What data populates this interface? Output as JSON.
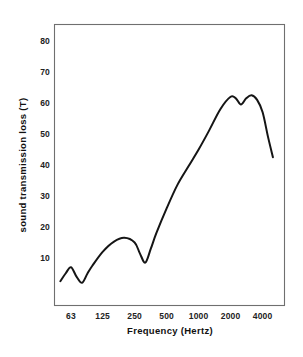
{
  "figure": {
    "background_color": "#ffffff",
    "frame_color": "#6f6f6f",
    "curve_color": "#151515"
  },
  "chart_data": {
    "type": "line",
    "title": "",
    "subtitle": "",
    "xlabel": "Frequency   (Hertz)",
    "ylabel": "sound transmission loss (T)",
    "x_scale": "log2-octave",
    "x_tick_labels": [
      "63",
      "125",
      "250",
      "500",
      "1000",
      "2000",
      "4000"
    ],
    "x_tick_values": [
      63,
      125,
      250,
      500,
      1000,
      2000,
      4000
    ],
    "y_tick_labels": [
      "10",
      "20",
      "30",
      "40",
      "50",
      "60",
      "70",
      "80"
    ],
    "y_tick_values": [
      10,
      20,
      30,
      40,
      50,
      60,
      70,
      80
    ],
    "ylim": [
      0,
      86
    ],
    "xlim": [
      44,
      5900
    ],
    "grid": false,
    "legend": null,
    "series": [
      {
        "name": "sound transmission loss",
        "x": [
          50,
          56,
          63,
          71,
          80,
          90,
          100,
          125,
          160,
          200,
          250,
          280,
          315,
          355,
          400,
          500,
          630,
          800,
          1000,
          1250,
          1600,
          2000,
          2240,
          2500,
          2800,
          3150,
          3550,
          4000,
          4500,
          5000
        ],
        "y": [
          2.5,
          5.0,
          7.0,
          4.0,
          2.0,
          5.0,
          7.5,
          12.0,
          15.3,
          16.5,
          15.0,
          11.5,
          8.5,
          13.0,
          18.0,
          26.0,
          33.5,
          39.5,
          45.0,
          51.0,
          58.0,
          62.0,
          61.5,
          59.5,
          61.5,
          62.5,
          61.0,
          57.0,
          49.0,
          42.5
        ]
      }
    ],
    "annotations": []
  }
}
